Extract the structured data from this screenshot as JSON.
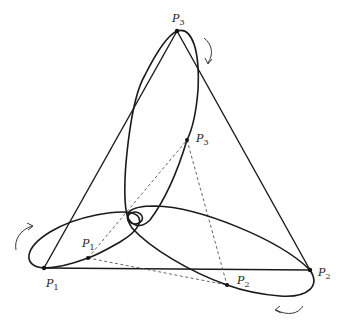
{
  "diagram": {
    "outer_triangle": {
      "P1": {
        "label": "P",
        "sub": "1",
        "x": 44,
        "y": 268
      },
      "P2": {
        "label": "P",
        "sub": "2",
        "x": 310,
        "y": 270
      },
      "P3": {
        "label": "P",
        "sub": "3",
        "x": 177,
        "y": 31
      }
    },
    "inner_triangle": {
      "P1": {
        "label": "P",
        "sub": "1",
        "x": 88,
        "y": 258
      },
      "P2": {
        "label": "P",
        "sub": "2",
        "x": 227,
        "y": 285
      },
      "P3": {
        "label": "P",
        "sub": "3",
        "x": 187,
        "y": 140
      }
    },
    "rotation_arrows": 3,
    "colors": {
      "stroke": "#1a1a1a",
      "dashed": "#555555",
      "background": "#ffffff"
    }
  }
}
